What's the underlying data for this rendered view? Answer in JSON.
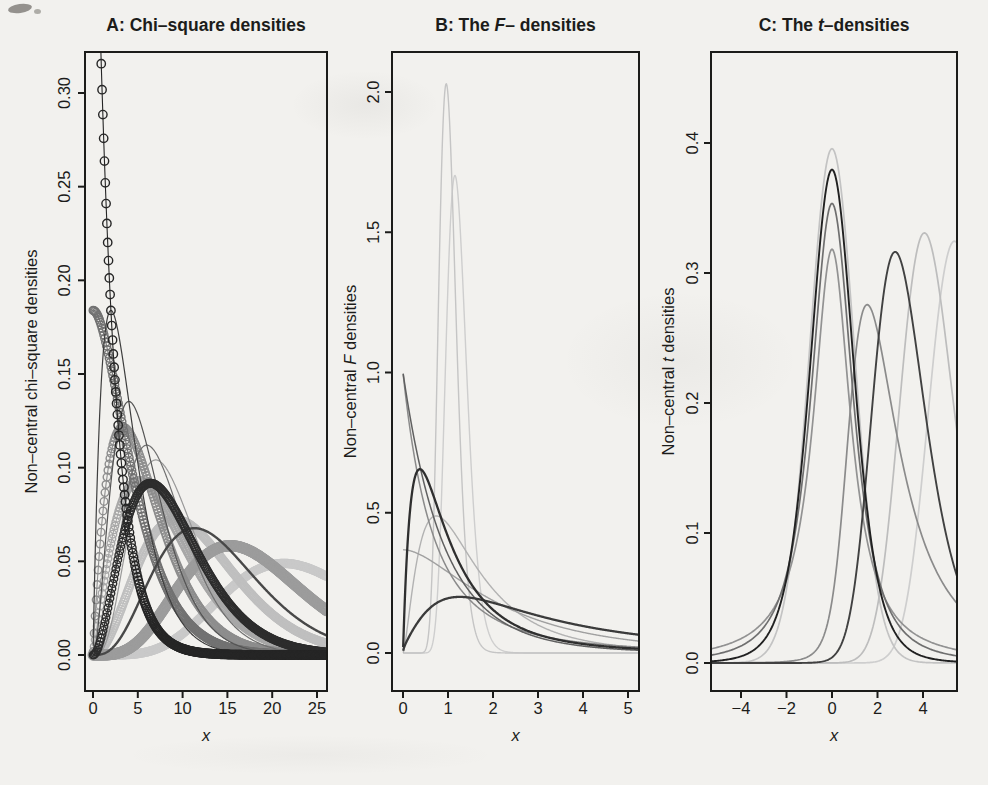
{
  "page": {
    "background": "#f2f1ee",
    "ink": "#1c1c1a"
  },
  "chart_data": [
    {
      "id": "A",
      "type": "line",
      "distribution": "non-central chi-square density curves, dchisq(x, df, ncp)",
      "title_parts": [
        {
          "t": "A: Chi–square densities",
          "i": false
        }
      ],
      "xlabel_parts": [
        {
          "t": "x",
          "i": true
        }
      ],
      "ylabel_parts": [
        {
          "t": "Non–central chi–square densities",
          "i": false
        }
      ],
      "xlim": [
        -0.9,
        26.1
      ],
      "ylim": [
        0,
        0.322
      ],
      "grid": false,
      "legend": "none",
      "xticks": [
        {
          "v": 0,
          "label": "0"
        },
        {
          "v": 5,
          "label": "5"
        },
        {
          "v": 10,
          "label": "10"
        },
        {
          "v": 15,
          "label": "15"
        },
        {
          "v": 20,
          "label": "20"
        },
        {
          "v": 25,
          "label": "25"
        }
      ],
      "yticks": [
        {
          "v": 0,
          "label": "0.00"
        },
        {
          "v": 0.05,
          "label": "0.05"
        },
        {
          "v": 0.1,
          "label": "0.10"
        },
        {
          "v": 0.15,
          "label": "0.15"
        },
        {
          "v": 0.2,
          "label": "0.20"
        },
        {
          "v": 0.25,
          "label": "0.25"
        },
        {
          "v": 0.3,
          "label": "0.30"
        }
      ],
      "x_samples": {
        "from": 0.02,
        "to": 26.1,
        "step": 0.06
      },
      "series": [
        {
          "name": "chisq df=12 ncp=12",
          "df": 12,
          "ncp": 12,
          "color": "#c9c9c9",
          "lw": 1.1,
          "markers": true,
          "marker_r": 4.0,
          "marker_step": 0.1
        },
        {
          "name": "chisq df=6 ncp=6",
          "df": 6,
          "ncp": 6,
          "color": "#bfbfbf",
          "lw": 1.1,
          "markers": true,
          "marker_r": 4.0,
          "marker_step": 0.1
        },
        {
          "name": "chisq df=4 ncp=4",
          "df": 4,
          "ncp": 4,
          "color": "#a7a7a7",
          "lw": 1.1,
          "markers": true,
          "marker_r": 3.8,
          "marker_step": 0.11
        },
        {
          "name": "chisq df=10 ncp=8",
          "df": 10,
          "ncp": 8,
          "color": "#9c9c9c",
          "lw": 1.4,
          "markers": true,
          "marker_r": 5.0,
          "marker_step": 0.08
        },
        {
          "name": "chisq df=9 ncp=0",
          "df": 9,
          "ncp": 0,
          "color": "#989898",
          "lw": 1.2,
          "markers": false
        },
        {
          "name": "chisq df=4 ncp=2",
          "df": 4,
          "ncp": 2,
          "color": "#8d8d8d",
          "lw": 1.1,
          "markers": true,
          "marker_r": 3.8,
          "marker_step": 0.11
        },
        {
          "name": "chisq df=2 ncp=2",
          "df": 2,
          "ncp": 2,
          "color": "#727272",
          "lw": 1.1,
          "markers": true,
          "marker_r": 4.0,
          "marker_step": 0.1
        },
        {
          "name": "chisq df=8 ncp=0",
          "df": 8,
          "ncp": 0,
          "color": "#6f6f6f",
          "lw": 1.2,
          "markers": false
        },
        {
          "name": "chisq df=6 ncp=0",
          "df": 6,
          "ncp": 0,
          "color": "#545454",
          "lw": 1.2,
          "markers": false
        },
        {
          "name": "chisq df=8 ncp=6",
          "df": 8,
          "ncp": 6,
          "color": "#484848",
          "lw": 2.4,
          "markers": false
        },
        {
          "name": "chisq df=4 ncp=0",
          "df": 4,
          "ncp": 0,
          "color": "#3e3e3e",
          "lw": 1.2,
          "markers": false
        },
        {
          "name": "chisq df=6 ncp=3",
          "df": 6,
          "ncp": 3,
          "color": "#2d2d2d",
          "lw": 1.1,
          "markers": true,
          "marker_r": 3.8,
          "marker_step": 0.11
        },
        {
          "name": "chisq df=2 ncp=0",
          "df": 2,
          "ncp": 0,
          "color": "#262626",
          "lw": 1.1,
          "markers": true,
          "marker_r": 4.2,
          "marker_step": 0.09
        }
      ]
    },
    {
      "id": "B",
      "type": "line",
      "distribution": "non-central F density curves, df(x, df1, df2, ncp)",
      "title_parts": [
        {
          "t": "B: The ",
          "i": false
        },
        {
          "t": "F",
          "i": true
        },
        {
          "t": "– densities",
          "i": false
        }
      ],
      "xlabel_parts": [
        {
          "t": "x",
          "i": true
        }
      ],
      "ylabel_parts": [
        {
          "t": "Non–central ",
          "i": false
        },
        {
          "t": "F",
          "i": true
        },
        {
          "t": " densities",
          "i": false
        }
      ],
      "xlim": [
        -0.25,
        5.25
      ],
      "ylim": [
        0,
        2.13
      ],
      "grid": false,
      "legend": "none",
      "xticks": [
        {
          "v": 0,
          "label": "0"
        },
        {
          "v": 1,
          "label": "1"
        },
        {
          "v": 2,
          "label": "2"
        },
        {
          "v": 3,
          "label": "3"
        },
        {
          "v": 4,
          "label": "4"
        },
        {
          "v": 5,
          "label": "5"
        }
      ],
      "yticks": [
        {
          "v": 0,
          "label": "0.0"
        },
        {
          "v": 0.5,
          "label": "0.5"
        },
        {
          "v": 1,
          "label": "1.0"
        },
        {
          "v": 1.5,
          "label": "1.5"
        },
        {
          "v": 2,
          "label": "2.0"
        }
      ],
      "x_samples": {
        "from": 0.004,
        "to": 5.3,
        "step": 0.012
      },
      "series": [
        {
          "name": "F df1=100 df2=100 ncp=20",
          "df1": 100,
          "df2": 100,
          "ncp": 20,
          "color": "#cecece",
          "lw": 1.4,
          "markers": false
        },
        {
          "name": "F df1=100 df2=100 ncp=0",
          "df1": 100,
          "df2": 100,
          "ncp": 0,
          "color": "#c5c5c5",
          "lw": 1.4,
          "markers": false
        },
        {
          "name": "F df1=5 df2=10 ncp=2",
          "df1": 5,
          "df2": 10,
          "ncp": 2,
          "color": "#b2b2b2",
          "lw": 1.4,
          "markers": false
        },
        {
          "name": "F df1=2 df2=10 ncp=2",
          "df1": 2,
          "df2": 10,
          "ncp": 2,
          "color": "#a0a0a0",
          "lw": 1.4,
          "markers": false
        },
        {
          "name": "F df1=2 df2=4 ncp=0",
          "df1": 2,
          "df2": 4,
          "ncp": 0,
          "color": "#8b8b8b",
          "lw": 1.5,
          "markers": false
        },
        {
          "name": "F df1=2 df2=20 ncp=0",
          "df1": 2,
          "df2": 20,
          "ncp": 0,
          "color": "#606060",
          "lw": 1.5,
          "markers": false
        },
        {
          "name": "F df1=3 df2=4 ncp=6",
          "df1": 3,
          "df2": 4,
          "ncp": 6,
          "color": "#3b3b3b",
          "lw": 2.3,
          "markers": false
        },
        {
          "name": "F df1=4 df2=6 ncp=0",
          "df1": 4,
          "df2": 6,
          "ncp": 0,
          "color": "#2f2f2f",
          "lw": 2.3,
          "markers": false
        }
      ]
    },
    {
      "id": "C",
      "type": "line",
      "distribution": "non-central t density curves, dt(x, df, ncp)",
      "title_parts": [
        {
          "t": "C: The ",
          "i": false
        },
        {
          "t": "t",
          "i": true
        },
        {
          "t": "–densities",
          "i": false
        }
      ],
      "xlabel_parts": [
        {
          "t": "x",
          "i": true
        }
      ],
      "ylabel_parts": [
        {
          "t": "Non–central ",
          "i": false
        },
        {
          "t": "t",
          "i": true
        },
        {
          "t": " densities",
          "i": false
        }
      ],
      "xlim": [
        -5.4,
        5.5
      ],
      "ylim": [
        0,
        0.47
      ],
      "grid": false,
      "legend": "none",
      "xticks": [
        {
          "v": -4,
          "label": "−4"
        },
        {
          "v": -2,
          "label": "−2"
        },
        {
          "v": 0,
          "label": "0"
        },
        {
          "v": 2,
          "label": "2"
        },
        {
          "v": 4,
          "label": "4"
        }
      ],
      "yticks": [
        {
          "v": 0,
          "label": "0.0"
        },
        {
          "v": 0.1,
          "label": "0.1"
        },
        {
          "v": 0.2,
          "label": "0.2"
        },
        {
          "v": 0.3,
          "label": "0.3"
        },
        {
          "v": 0.4,
          "label": "0.4"
        }
      ],
      "x_samples": {
        "from": -5.4,
        "to": 5.5,
        "step": 0.05
      },
      "series": [
        {
          "name": "t df=30 ncp=5.5",
          "df": 30,
          "ncp": 5.5,
          "color": "#cecece",
          "lw": 1.7,
          "markers": false
        },
        {
          "name": "t df=30 ncp=0",
          "df": 30,
          "ncp": 0,
          "color": "#c3c3c3",
          "lw": 1.7,
          "markers": false
        },
        {
          "name": "t df=20 ncp=4.2",
          "df": 20,
          "ncp": 4.2,
          "color": "#bdbdbd",
          "lw": 1.7,
          "markers": false
        },
        {
          "name": "t df=1 ncp=0",
          "df": 1,
          "ncp": 0,
          "color": "#929292",
          "lw": 1.7,
          "markers": false
        },
        {
          "name": "t df=2 ncp=2",
          "df": 2,
          "ncp": 2,
          "color": "#8b8b8b",
          "lw": 1.7,
          "markers": false
        },
        {
          "name": "t df=2 ncp=0",
          "df": 2,
          "ncp": 0,
          "color": "#6f6f6f",
          "lw": 1.7,
          "markers": false
        },
        {
          "name": "t df=8 ncp=3",
          "df": 8,
          "ncp": 3,
          "color": "#414141",
          "lw": 1.9,
          "markers": false
        },
        {
          "name": "t df=5 ncp=0",
          "df": 5,
          "ncp": 0,
          "color": "#212121",
          "lw": 1.9,
          "markers": false
        }
      ]
    }
  ]
}
